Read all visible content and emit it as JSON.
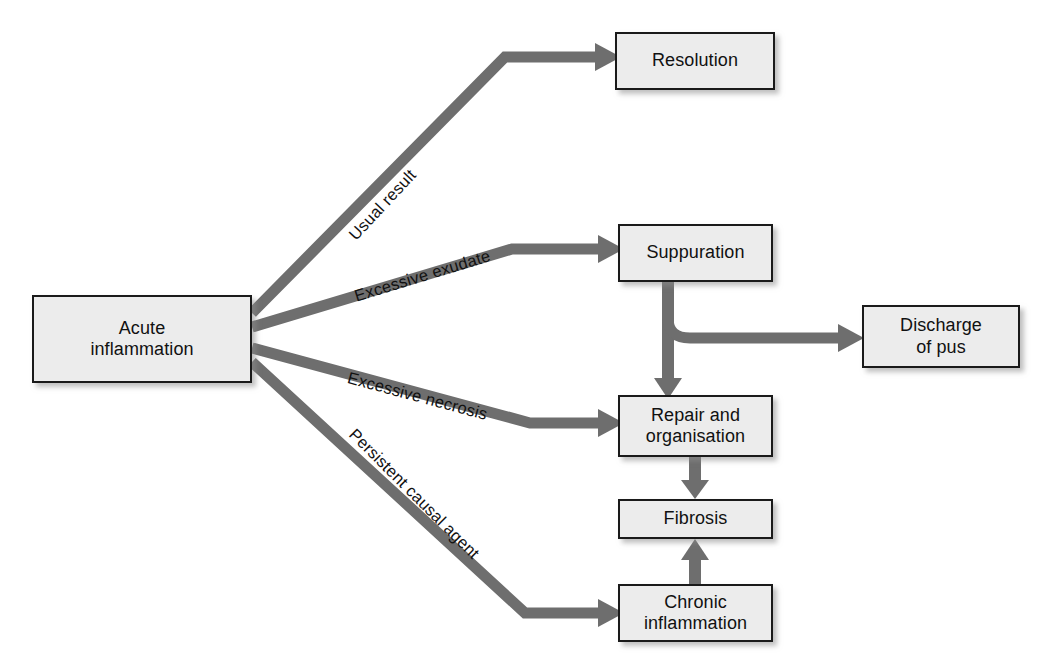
{
  "diagram": {
    "palette": {
      "box_fill": "#ececec",
      "box_border": "#1a1a1a",
      "arrow": "#6e6e6e",
      "text": "#111111",
      "background": "#ffffff"
    },
    "nodes": [
      {
        "id": "acute-inflammation",
        "label": "Acute\ninflammation",
        "x": 32,
        "y": 295,
        "w": 220,
        "h": 88
      },
      {
        "id": "resolution",
        "label": "Resolution",
        "x": 615,
        "y": 32,
        "w": 160,
        "h": 58
      },
      {
        "id": "suppuration",
        "label": "Suppuration",
        "x": 618,
        "y": 224,
        "w": 155,
        "h": 58
      },
      {
        "id": "discharge-of-pus",
        "label": "Discharge\nof pus",
        "x": 862,
        "y": 305,
        "w": 158,
        "h": 63
      },
      {
        "id": "repair-and-organisation",
        "label": "Repair and\norganisation",
        "x": 618,
        "y": 395,
        "w": 155,
        "h": 62
      },
      {
        "id": "fibrosis",
        "label": "Fibrosis",
        "x": 618,
        "y": 499,
        "w": 155,
        "h": 40
      },
      {
        "id": "chronic-inflammation",
        "label": "Chronic\ninflammation",
        "x": 618,
        "y": 584,
        "w": 155,
        "h": 58
      }
    ],
    "edge_labels": [
      {
        "id": "usual-result",
        "text": "Usual result",
        "x": 352,
        "y": 228,
        "rotate": -47
      },
      {
        "id": "excessive-exudate",
        "text": "Excessive exudate",
        "x": 355,
        "y": 287,
        "rotate": -17
      },
      {
        "id": "excessive-necrosis",
        "text": "Excessive necrosis",
        "x": 348,
        "y": 368,
        "rotate": 15
      },
      {
        "id": "persistent-causal-agent",
        "text": "Persistent causal agent",
        "x": 352,
        "y": 422,
        "rotate": 45
      }
    ],
    "edges": [
      {
        "id": "acute-to-resolution",
        "from": "acute-inflammation",
        "to": "resolution",
        "label": "Usual result"
      },
      {
        "id": "acute-to-suppuration",
        "from": "acute-inflammation",
        "to": "suppuration",
        "label": "Excessive exudate"
      },
      {
        "id": "acute-to-repair",
        "from": "acute-inflammation",
        "to": "repair-and-organisation",
        "label": "Excessive necrosis"
      },
      {
        "id": "acute-to-chronic",
        "from": "acute-inflammation",
        "to": "chronic-inflammation",
        "label": "Persistent causal agent"
      },
      {
        "id": "suppuration-to-discharge",
        "from": "suppuration",
        "to": "discharge-of-pus",
        "label": ""
      },
      {
        "id": "suppuration-to-repair",
        "from": "suppuration",
        "to": "repair-and-organisation",
        "label": ""
      },
      {
        "id": "repair-to-fibrosis",
        "from": "repair-and-organisation",
        "to": "fibrosis",
        "label": ""
      },
      {
        "id": "chronic-to-fibrosis",
        "from": "chronic-inflammation",
        "to": "fibrosis",
        "label": ""
      }
    ]
  }
}
